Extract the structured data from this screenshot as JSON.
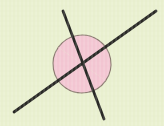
{
  "figure": {
    "width": 164,
    "height": 126,
    "background_color": "#e9f0cf",
    "intersection": {
      "x": 82,
      "y": 64
    },
    "lines": [
      {
        "name": "steep-line",
        "description": "Steeper line running from upper-left to lower-right",
        "x1": 63,
        "y1": 11,
        "x2": 104,
        "y2": 119,
        "stroke_color": "#2a2a26",
        "stroke_width": 2.8
      },
      {
        "name": "shallow-line",
        "description": "Shallower line running from lower-left to upper-right",
        "x1": 14,
        "y1": 112,
        "x2": 156,
        "y2": 11,
        "stroke_color": "#2a2a26",
        "stroke_width": 2.8
      }
    ],
    "angle_sectors": [
      {
        "name": "upper-angle-sector",
        "description": "Shaded obtuse angle above the intersection",
        "fill_color": "#f3c6d2",
        "arc_stroke_color": "#8a7a70",
        "arc_stroke_width": 1.1,
        "radius": 29,
        "start_angle_deg": 215,
        "end_angle_deg": 35
      },
      {
        "name": "lower-angle-sector",
        "description": "Shaded obtuse angle below the intersection (vertical angle)",
        "fill_color": "#f3c6d2",
        "arc_stroke_color": "#8a7a70",
        "arc_stroke_width": 1.1,
        "radius": 29,
        "start_angle_deg": 35,
        "end_angle_deg": 215
      }
    ]
  }
}
